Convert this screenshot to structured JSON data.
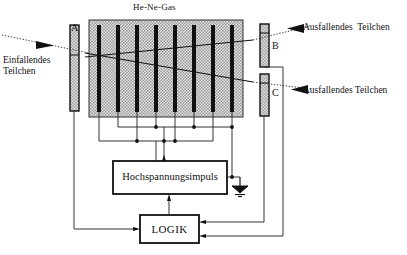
{
  "figure": {
    "kind": "spark-chamber-schematic",
    "title": "He-Ne-Gas",
    "background_color": "#ffffff",
    "ink_color": "#111111",
    "chamber_fill": "#d9d9d9",
    "electrode_color": "#111111",
    "detector_fill": "#cccccc"
  },
  "chamber": {
    "gas_label": "He-Ne-Gas",
    "electrode_count": 8,
    "x": 89,
    "y": 20,
    "width": 154,
    "height": 97
  },
  "detectors": [
    {
      "id": "A",
      "label": "A",
      "x": 70,
      "y": 25,
      "width": 9,
      "height": 86,
      "label_x": 71,
      "label_y": 22
    },
    {
      "id": "B",
      "label": "B",
      "x": 260,
      "y": 24,
      "width": 9,
      "height": 43,
      "label_x": 272,
      "label_y": 44
    },
    {
      "id": "C",
      "label": "C",
      "x": 260,
      "y": 74,
      "width": 9,
      "height": 42,
      "label_x": 272,
      "label_y": 90
    }
  ],
  "particle_labels": {
    "incoming": "Einfallendes\nTeilchen",
    "outgoing_upper": "Ausfallendes  Teilchen",
    "outgoing_lower": "Ausfallendes Teilchen"
  },
  "boxes": [
    {
      "id": "hv",
      "label": "Hochspannungsimpuls",
      "x": 113,
      "y": 161,
      "width": 114,
      "height": 33
    },
    {
      "id": "logic",
      "label": "LOGIK",
      "x": 140,
      "y": 215,
      "width": 59,
      "height": 28
    }
  ],
  "symbols": {
    "ground": "earth-ground",
    "incoming_arrow": "arrow-right",
    "outgoing_arrow": "arrow-left"
  }
}
